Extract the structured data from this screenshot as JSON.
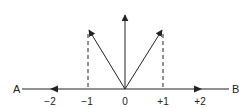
{
  "diagram": {
    "type": "vector-number-line",
    "axis": {
      "start_label": "A",
      "end_label": "B"
    },
    "ticks": [
      {
        "label": "−2",
        "value": -2
      },
      {
        "label": "−1",
        "value": -1
      },
      {
        "label": "0",
        "value": 0
      },
      {
        "label": "+1",
        "value": 1
      },
      {
        "label": "+2",
        "value": 2
      }
    ],
    "vectors": [
      {
        "name": "vertical",
        "from": [
          0,
          0
        ],
        "to": [
          0,
          1.5
        ]
      },
      {
        "name": "left-diagonal",
        "from": [
          0,
          0
        ],
        "to": [
          -1,
          1.2
        ]
      },
      {
        "name": "right-diagonal",
        "from": [
          0,
          0
        ],
        "to": [
          1,
          1.2
        ]
      },
      {
        "name": "axis-left-arrow",
        "at": -2,
        "direction": "left"
      },
      {
        "name": "axis-right-arrow",
        "at": 2,
        "direction": "right"
      }
    ],
    "projections": [
      {
        "x": -1,
        "style": "dashed"
      },
      {
        "x": 1,
        "style": "dashed"
      }
    ],
    "colors": {
      "stroke": "#222222"
    }
  }
}
